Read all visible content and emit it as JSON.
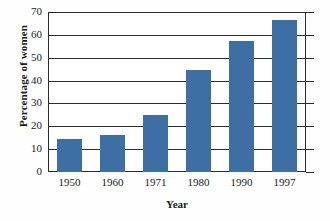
{
  "chart_data": {
    "type": "bar",
    "title": "",
    "xlabel": "Year",
    "ylabel": "Percentage of women",
    "categories": [
      "1950",
      "1960",
      "1971",
      "1980",
      "1990",
      "1997"
    ],
    "values": [
      14.5,
      16,
      25,
      44.5,
      57.5,
      66.5
    ],
    "ylim": [
      0,
      70
    ],
    "yticks": [
      "0",
      "10",
      "20",
      "30",
      "40",
      "50",
      "60",
      "70"
    ],
    "ytick_values": [
      0,
      10,
      20,
      30,
      40,
      50,
      60,
      70
    ],
    "grid": "horizontal",
    "legend": "none",
    "bar_color": "#3d6fa5",
    "axis_color": "#2b2b2b",
    "background_color": "#ffffff"
  }
}
